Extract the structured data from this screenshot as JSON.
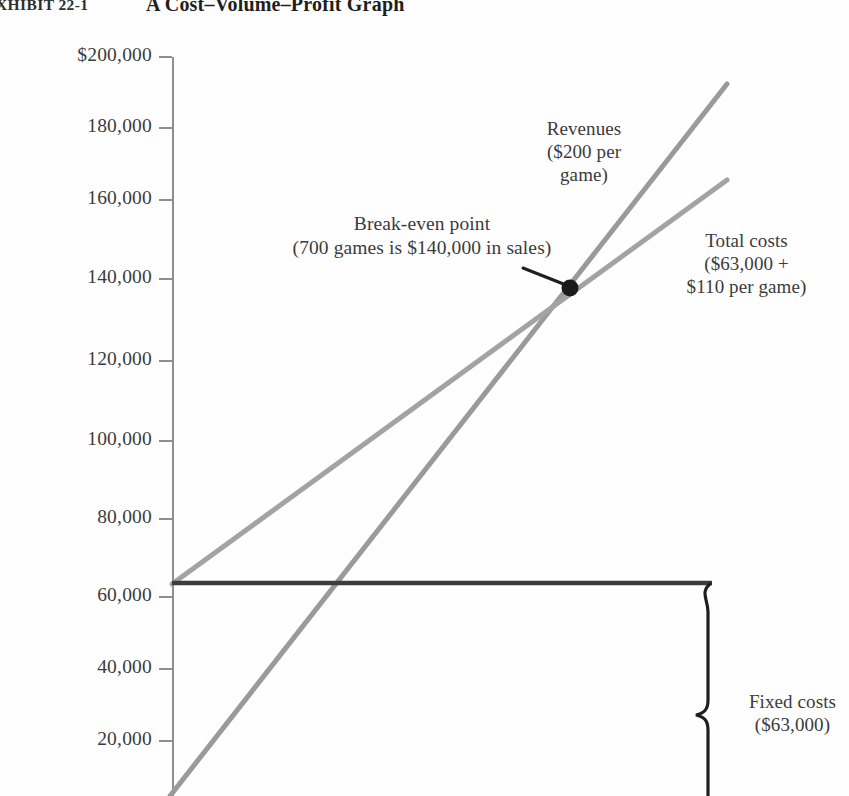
{
  "figure": {
    "exhibit_label": "XHIBIT 22-1",
    "title": "A Cost–Volume–Profit Graph"
  },
  "chart_data": {
    "type": "line",
    "title": "A Cost–Volume–Profit Graph",
    "xlabel": "",
    "ylabel": "",
    "ylim": [
      0,
      200000
    ],
    "xlim": [
      0,
      1000
    ],
    "grid": false,
    "legend": "annotations",
    "y_ticks": [
      200000,
      180000,
      160000,
      140000,
      120000,
      100000,
      80000,
      60000,
      40000,
      20000
    ],
    "y_tick_labels": [
      "$200,000",
      "180,000",
      "160,000",
      "140,000",
      "120,000",
      "100,000",
      "80,000",
      "60,000",
      "40,000",
      "20,000"
    ],
    "series": [
      {
        "name": "Revenues",
        "description": "$200 per game",
        "color": "#9a9a9a",
        "intercept": 0,
        "slope_per_game": 200,
        "points": [
          [
            0,
            0
          ],
          [
            960,
            192000
          ]
        ]
      },
      {
        "name": "Total costs",
        "description": "$63,000 + $110 per game",
        "color": "#a2a2a2",
        "intercept": 63000,
        "slope_per_game": 110,
        "points": [
          [
            0,
            63000
          ],
          [
            960,
            168600
          ]
        ]
      },
      {
        "name": "Fixed costs",
        "description": "$63,000",
        "color": "#3a3a3a",
        "intercept": 63000,
        "slope_per_game": 0,
        "points": [
          [
            0,
            63000
          ],
          [
            960,
            63000
          ]
        ]
      }
    ],
    "annotations": [
      {
        "name": "break-even-point",
        "games": 700,
        "sales": 140000,
        "text": "Break-even point\n(700  games is $140,000 in sales)"
      },
      {
        "name": "revenues",
        "text": "Revenues\n($200 per\ngame)"
      },
      {
        "name": "total-costs",
        "text": "Total costs\n($63,000 +\n$110 per game)"
      },
      {
        "name": "fixed-costs",
        "text": "Fixed costs\n($63,000)"
      }
    ]
  },
  "labels": {
    "revenues": "Revenues\n($200 per\ngame)",
    "break_even": "Break-even point\n(700  games is $140,000 in sales)",
    "total_costs": "Total costs\n($63,000 +\n$110 per game)",
    "fixed_costs": "Fixed costs\n($63,000)"
  },
  "ticks": [
    {
      "label": "$200,000",
      "y": 57
    },
    {
      "label": "180,000",
      "y": 128
    },
    {
      "label": "160,000",
      "y": 200
    },
    {
      "label": "140,000",
      "y": 279
    },
    {
      "label": "120,000",
      "y": 361
    },
    {
      "label": "100,000",
      "y": 441
    },
    {
      "label": "80,000",
      "y": 519
    },
    {
      "label": "60,000",
      "y": 597
    },
    {
      "label": "40,000",
      "y": 669
    },
    {
      "label": "20,000",
      "y": 741
    }
  ],
  "colors": {
    "revenue_line": "#9a9a9a",
    "cost_line": "#a2a2a2",
    "fixed_line": "#3a3a3a",
    "axis": "#8e8e8e",
    "text": "#3b3b3b"
  }
}
